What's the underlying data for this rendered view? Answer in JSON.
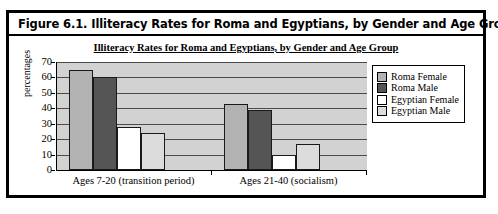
{
  "figure": {
    "caption": "Figure 6.1.  Illiteracy Rates for Roma and Egyptians, by Gender and Age Group"
  },
  "chart_data": {
    "type": "bar",
    "title": "Illiteracy Rates for Roma and Egyptians, by Gender and Age Group",
    "xlabel": "",
    "ylabel": "percentages",
    "ylim": [
      0,
      70
    ],
    "yticks": [
      0,
      10,
      20,
      30,
      40,
      50,
      60,
      70
    ],
    "grid": true,
    "legend_position": "right",
    "categories": [
      "Ages 7-20 (transition period)",
      "Ages 21-40 (socialism)"
    ],
    "series": [
      {
        "name": "Roma Female",
        "color": "#b3b3b3",
        "values": [
          65,
          43
        ]
      },
      {
        "name": "Roma Male",
        "color": "#555555",
        "values": [
          60,
          39
        ]
      },
      {
        "name": "Egyptian Female",
        "color": "#ffffff",
        "values": [
          28,
          10
        ]
      },
      {
        "name": "Egyptian Male",
        "color": "#dcdcdc",
        "values": [
          24,
          17
        ]
      }
    ]
  }
}
